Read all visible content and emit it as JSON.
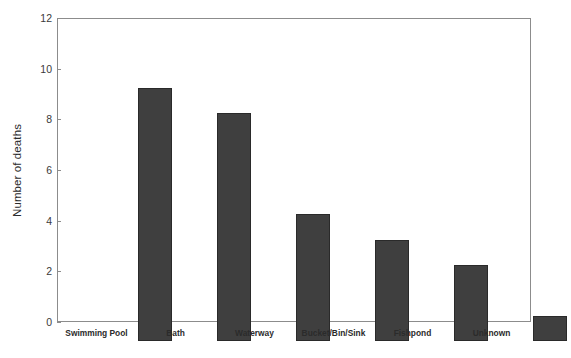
{
  "chart_data": {
    "type": "bar",
    "title": "",
    "xlabel": "",
    "ylabel": "Number of deaths",
    "categories": [
      "Swimming Pool",
      "Bath",
      "Waterway",
      "Bucket/Bin/Sink",
      "Fishpond",
      "Unknown"
    ],
    "values": [
      10,
      9,
      5,
      4,
      3,
      1
    ],
    "ylim": [
      0,
      12
    ],
    "yticks": [
      0,
      2,
      4,
      6,
      8,
      10,
      12
    ],
    "ytick_labels": [
      "0",
      "2",
      "4",
      "6",
      "8",
      "10",
      "12"
    ],
    "grid": false,
    "legend": null,
    "bar_color": "#3f3f3f",
    "bar_edge_color": "#2a2a2a",
    "frame_color": "#8c8c8c",
    "background_color": "#ffffff"
  }
}
